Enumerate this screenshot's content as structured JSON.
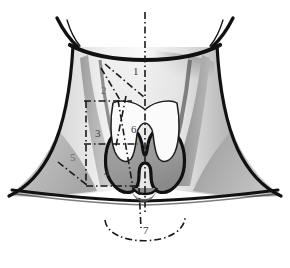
{
  "figure": {
    "background_color": "#ffffff",
    "outline_color": "#111111",
    "colors": {
      "skin_light": "#e9e9e9",
      "skin_mid": "#c6c6c6",
      "skin_shadow": "#8f8f8f",
      "thyroid_gland": "#9a9a9a",
      "thyroid_cartilage": "#fbfbfb",
      "label_text": "#3a3a3a",
      "dash_dot_line": "#1a1a1a"
    },
    "line_style": "dash-dot",
    "midline_label": "vertical dash-dot midline"
  },
  "labels": [
    {
      "id": "label-1",
      "text": "1",
      "x": 133,
      "y": 66
    },
    {
      "id": "label-2",
      "text": "2",
      "x": 101,
      "y": 85
    },
    {
      "id": "label-3",
      "text": "3",
      "x": 95,
      "y": 128
    },
    {
      "id": "label-4",
      "text": "4",
      "x": 104,
      "y": 167
    },
    {
      "id": "label-5",
      "text": "5",
      "x": 70,
      "y": 152
    },
    {
      "id": "label-6",
      "text": "6",
      "x": 131,
      "y": 124
    },
    {
      "id": "label-7",
      "text": "7",
      "x": 143,
      "y": 225
    }
  ],
  "structures": [
    {
      "id": "mandible",
      "name": "mandible-jaw-outline"
    },
    {
      "id": "ear-left",
      "name": "left-ear-outline"
    },
    {
      "id": "ear-right",
      "name": "right-ear-outline"
    },
    {
      "id": "neck",
      "name": "neck-contour"
    },
    {
      "id": "shoulders",
      "name": "shoulder-contour"
    },
    {
      "id": "clavicle",
      "name": "clavicle-line"
    },
    {
      "id": "scm-left",
      "name": "sternocleidomastoid-left"
    },
    {
      "id": "scm-right",
      "name": "sternocleidomastoid-right"
    },
    {
      "id": "thyroid-cartilage",
      "name": "thyroid-cartilage"
    },
    {
      "id": "thyroid-gland",
      "name": "thyroid-gland"
    },
    {
      "id": "suprasternal-arc",
      "name": "suprasternal-notch-arc"
    }
  ]
}
